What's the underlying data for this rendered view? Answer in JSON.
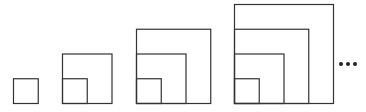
{
  "unit_px": 24.75,
  "baseline_y": 103,
  "stroke_color": "#333333",
  "figures": [
    {
      "stage": 1,
      "left_x": 13,
      "squares": [
        1
      ]
    },
    {
      "stage": 2,
      "left_x": 62,
      "squares": [
        1,
        2
      ]
    },
    {
      "stage": 3,
      "left_x": 136,
      "squares": [
        1,
        2,
        3
      ]
    },
    {
      "stage": 4,
      "left_x": 234,
      "squares": [
        1,
        2,
        3,
        4
      ]
    }
  ],
  "continuation": {
    "text": "...",
    "x": 338,
    "y": 64
  }
}
